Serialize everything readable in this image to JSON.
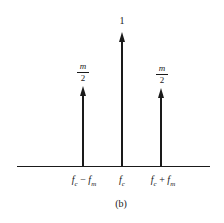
{
  "diagram": {
    "caption": "(b)",
    "axis": {
      "label": ""
    },
    "lines": [
      {
        "id": "lower-sideband",
        "x_label_main": "f",
        "x_label_sub1": "c",
        "x_label_op": " − ",
        "x_label_main2": "f",
        "x_label_sub2": "m",
        "amplitude_num": "m",
        "amplitude_den": "2"
      },
      {
        "id": "carrier",
        "x_label_main": "f",
        "x_label_sub1": "c",
        "amplitude": "1"
      },
      {
        "id": "upper-sideband",
        "x_label_main": "f",
        "x_label_sub1": "c",
        "x_label_op": " + ",
        "x_label_main2": "f",
        "x_label_sub2": "m",
        "amplitude_num": "m",
        "amplitude_den": "2"
      }
    ]
  }
}
